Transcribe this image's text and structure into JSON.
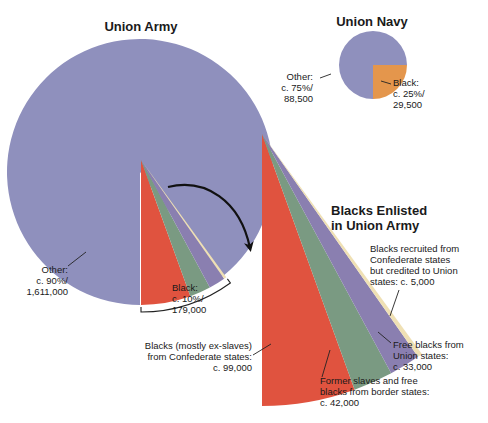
{
  "chart_data": [
    {
      "type": "pie",
      "title": "Union Army",
      "slices": [
        {
          "label": "Other",
          "percent": 90,
          "count": 1611000,
          "text": [
            "Other:",
            "c. 90%/",
            "1,611,000"
          ],
          "color": "#8f90bd"
        },
        {
          "label": "Black",
          "percent": 10,
          "count": 179000,
          "text": [
            "Black:",
            "c. 10%/",
            "179,000"
          ],
          "color": "#e0533f"
        }
      ]
    },
    {
      "type": "pie",
      "title": "Union Navy",
      "slices": [
        {
          "label": "Other",
          "percent": 75,
          "count": 88500,
          "text": [
            "Other:",
            "c. 75%/",
            "88,500"
          ],
          "color": "#8f90bd"
        },
        {
          "label": "Black",
          "percent": 25,
          "count": 29500,
          "text": [
            "Black:",
            "c. 25%/",
            "29,500"
          ],
          "color": "#e4964c"
        }
      ]
    },
    {
      "type": "pie",
      "title": "Blacks Enlisted in Union Army",
      "title_lines": [
        "Blacks Enlisted",
        "in Union Army"
      ],
      "slices": [
        {
          "label": "Blacks (mostly ex-slaves) from Confederate states",
          "count": 99000,
          "text": [
            "Blacks (mostly ex-slaves)",
            "from Confederate states:",
            "c. 99,000"
          ],
          "color": "#e0533f"
        },
        {
          "label": "Former slaves and free blacks from border states",
          "count": 42000,
          "text": [
            "Former slaves and free",
            "blacks from border states:",
            "c. 42,000"
          ],
          "color": "#7a9a82"
        },
        {
          "label": "Free blacks from Union states",
          "count": 33000,
          "text": [
            "Free blacks from",
            "Union states:",
            "c. 33,000"
          ],
          "color": "#8a7fb0"
        },
        {
          "label": "Blacks recruited from Confederate states but credited to Union states",
          "count": 5000,
          "text": [
            "Blacks recruited from",
            "Confederate states",
            "but credited to Union",
            "states: c. 5,000"
          ],
          "color": "#efe0b4"
        }
      ]
    }
  ],
  "colors": {
    "other": "#8f90bd",
    "army_black": "#e0533f",
    "navy_black": "#e4964c",
    "border": "#7a9a82",
    "free_union": "#8a7fb0",
    "credited": "#efe0b4",
    "text": "#1a1a1a"
  }
}
